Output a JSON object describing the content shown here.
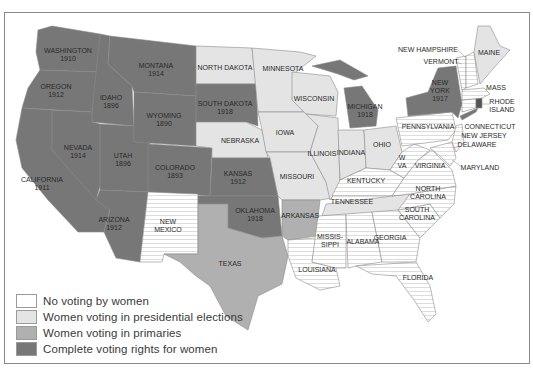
{
  "colors": {
    "none": "#ffffff",
    "presidential": "#e4e4e4",
    "primaries": "#b0b0b0",
    "complete": "#777777",
    "border": "#9a9a9a",
    "stripe": "#d8d8d8"
  },
  "states": {
    "washington": {
      "name": "WASHINGTON",
      "year": "1910",
      "status": "complete"
    },
    "oregon": {
      "name": "OREGON",
      "year": "1912",
      "status": "complete"
    },
    "california": {
      "name": "CALIFORNIA",
      "year": "1911",
      "status": "complete"
    },
    "idaho": {
      "name": "IDAHO",
      "year": "1896",
      "status": "complete"
    },
    "nevada": {
      "name": "NEVADA",
      "year": "1914",
      "status": "complete"
    },
    "utah": {
      "name": "UTAH",
      "year": "1896",
      "status": "complete"
    },
    "arizona": {
      "name": "ARIZONA",
      "year": "1912",
      "status": "complete"
    },
    "montana": {
      "name": "MONTANA",
      "year": "1914",
      "status": "complete"
    },
    "wyoming": {
      "name": "WYOMING",
      "year": "1890",
      "status": "complete"
    },
    "colorado": {
      "name": "COLORADO",
      "year": "1893",
      "status": "complete"
    },
    "new_mexico": {
      "name_line1": "NEW",
      "name_line2": "MEXICO",
      "status": "none"
    },
    "north_dakota": {
      "name": "NORTH DAKOTA",
      "status": "presidential"
    },
    "south_dakota": {
      "name": "SOUTH DAKOTA",
      "year": "1918",
      "status": "complete"
    },
    "nebraska": {
      "name": "NEBRASKA",
      "status": "presidential"
    },
    "kansas": {
      "name": "KANSAS",
      "year": "1912",
      "status": "complete"
    },
    "oklahoma": {
      "name": "OKLAHOMA",
      "year": "1918",
      "status": "complete"
    },
    "texas": {
      "name": "TEXAS",
      "status": "primaries"
    },
    "minnesota": {
      "name": "MINNESOTA",
      "status": "presidential"
    },
    "iowa": {
      "name": "IOWA",
      "status": "presidential"
    },
    "missouri": {
      "name": "MISSOURI",
      "status": "presidential"
    },
    "arkansas": {
      "name": "ARKANSAS",
      "status": "primaries"
    },
    "louisiana": {
      "name": "LOUISIANA",
      "status": "none"
    },
    "wisconsin": {
      "name": "WISCONSIN",
      "status": "presidential"
    },
    "illinois": {
      "name": "ILLINOIS",
      "status": "presidential"
    },
    "michigan": {
      "name": "MICHIGAN",
      "year": "1918",
      "status": "complete"
    },
    "indiana": {
      "name": "INDIANA",
      "status": "presidential"
    },
    "ohio": {
      "name": "OHIO",
      "status": "presidential"
    },
    "kentucky": {
      "name": "KENTUCKY",
      "status": "none"
    },
    "tennessee": {
      "name": "TENNESSEE",
      "status": "presidential"
    },
    "mississippi": {
      "name_line1": "MISSIS-",
      "name_line2": "SIPPI",
      "status": "none"
    },
    "alabama": {
      "name": "ALABAMA",
      "status": "none"
    },
    "georgia": {
      "name": "GEORGIA",
      "status": "none"
    },
    "florida": {
      "name": "FLORIDA",
      "status": "none"
    },
    "south_carolina": {
      "name_line1": "SOUTH",
      "name_line2": "CAROLINA",
      "status": "none"
    },
    "north_carolina": {
      "name_line1": "NORTH",
      "name_line2": "CAROLINA",
      "status": "none"
    },
    "virginia": {
      "name": "VIRGINIA",
      "status": "none"
    },
    "west_virginia": {
      "name_line1": "W",
      "name_line2": "VA",
      "status": "none"
    },
    "pennsylvania": {
      "name": "PENNSYLVANIA",
      "status": "none"
    },
    "new_york": {
      "name_line1": "NEW",
      "name_line2": "YORK",
      "year": "1917",
      "status": "complete"
    },
    "maryland": {
      "name": "MARYLAND",
      "status": "none"
    },
    "delaware": {
      "name": "DELAWARE",
      "status": "none"
    },
    "new_jersey": {
      "name": "NEW JERSEY",
      "status": "none"
    },
    "connecticut": {
      "name": "CONNECTICUT",
      "status": "none"
    },
    "rhode_island": {
      "name_line1": "RHODE",
      "name_line2": "ISLAND",
      "status": "presidential"
    },
    "massachusetts": {
      "name": "MASS",
      "status": "none"
    },
    "vermont": {
      "name": "VERMONT",
      "status": "none"
    },
    "new_hampshire": {
      "name": "NEW HAMPSHIRE",
      "status": "none"
    },
    "maine": {
      "name": "MAINE",
      "status": "presidential"
    }
  },
  "legend": [
    {
      "label": "No voting by women",
      "key": "none"
    },
    {
      "label": "Women voting in presidential elections",
      "key": "presidential"
    },
    {
      "label": "Women voting in primaries",
      "key": "primaries"
    },
    {
      "label": "Complete voting rights for women",
      "key": "complete"
    }
  ]
}
